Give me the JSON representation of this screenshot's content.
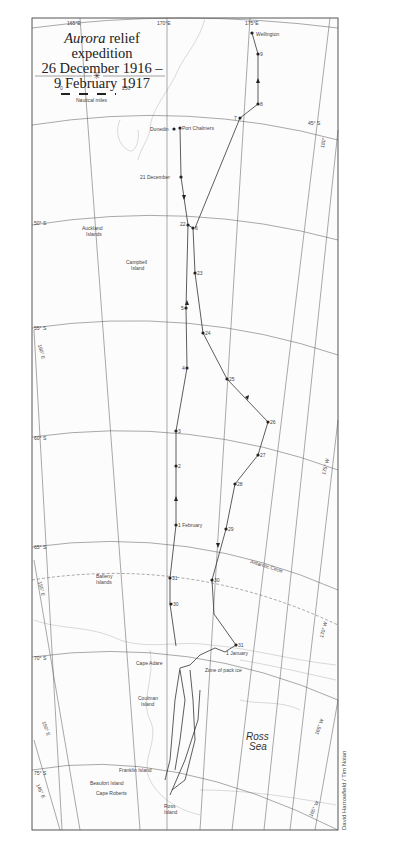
{
  "title": {
    "line1_italic": "Aurora",
    "line1_rest": " relief expedition",
    "line2": "26 December 1916 –",
    "line3": "9 February 1917"
  },
  "scale_bar": {
    "min_label": "0",
    "max_label": "250",
    "unit_label": "Nautical miles"
  },
  "graticule": {
    "longitudes_top": [
      "165°E",
      "170°E",
      "175°E"
    ],
    "latitudes": [
      "45° S",
      "50° S",
      "55° S",
      "60° S",
      "65° S",
      "70° S",
      "75° S"
    ],
    "meridians_left": [
      "160° E",
      "155° E",
      "150° E",
      "145° E"
    ],
    "meridians_right": [
      "180°",
      "175° W",
      "170° W",
      "165° W",
      "160° W"
    ],
    "antarctic_circle": "Antarctic Circle"
  },
  "places": {
    "wellington": "Wellington",
    "dunedin": "Dunedin",
    "port_chalmers": "Port Chalmers",
    "auckland_islands": [
      "Auckland",
      "Islands"
    ],
    "campbell_island": [
      "Campbell",
      "Island"
    ],
    "balleny_islands": [
      "Balleny",
      "Islands"
    ],
    "cape_adare": "Cape Adare",
    "coulman_island": [
      "Coulman",
      "Island"
    ],
    "franklin_island": "Franklin Island",
    "beaufort_island": "Beaufort Island",
    "cape_roberts": "Cape Roberts",
    "ross_island": [
      "Ross",
      "Island"
    ],
    "ross_sea": [
      "Ross",
      "Sea"
    ],
    "zone_of_pack_ice": "Zone of pack ice"
  },
  "route_labels": {
    "outbound": [
      "21 December",
      "22",
      "23",
      "24",
      "25",
      "26",
      "27",
      "28",
      "29",
      "30",
      "31",
      "1 January"
    ],
    "return": [
      "1 February",
      "2",
      "3",
      "4",
      "5",
      "6",
      "7",
      "8",
      "9",
      "30",
      "31"
    ],
    "antarctic_coast": [
      "2",
      "3",
      "4",
      "5",
      "6",
      "7",
      "8",
      "17",
      "18",
      "20",
      "22",
      "23",
      "24",
      "25",
      "26",
      "27",
      "28",
      "29"
    ]
  },
  "credit": "David Harrowfield / Tim Nolan"
}
